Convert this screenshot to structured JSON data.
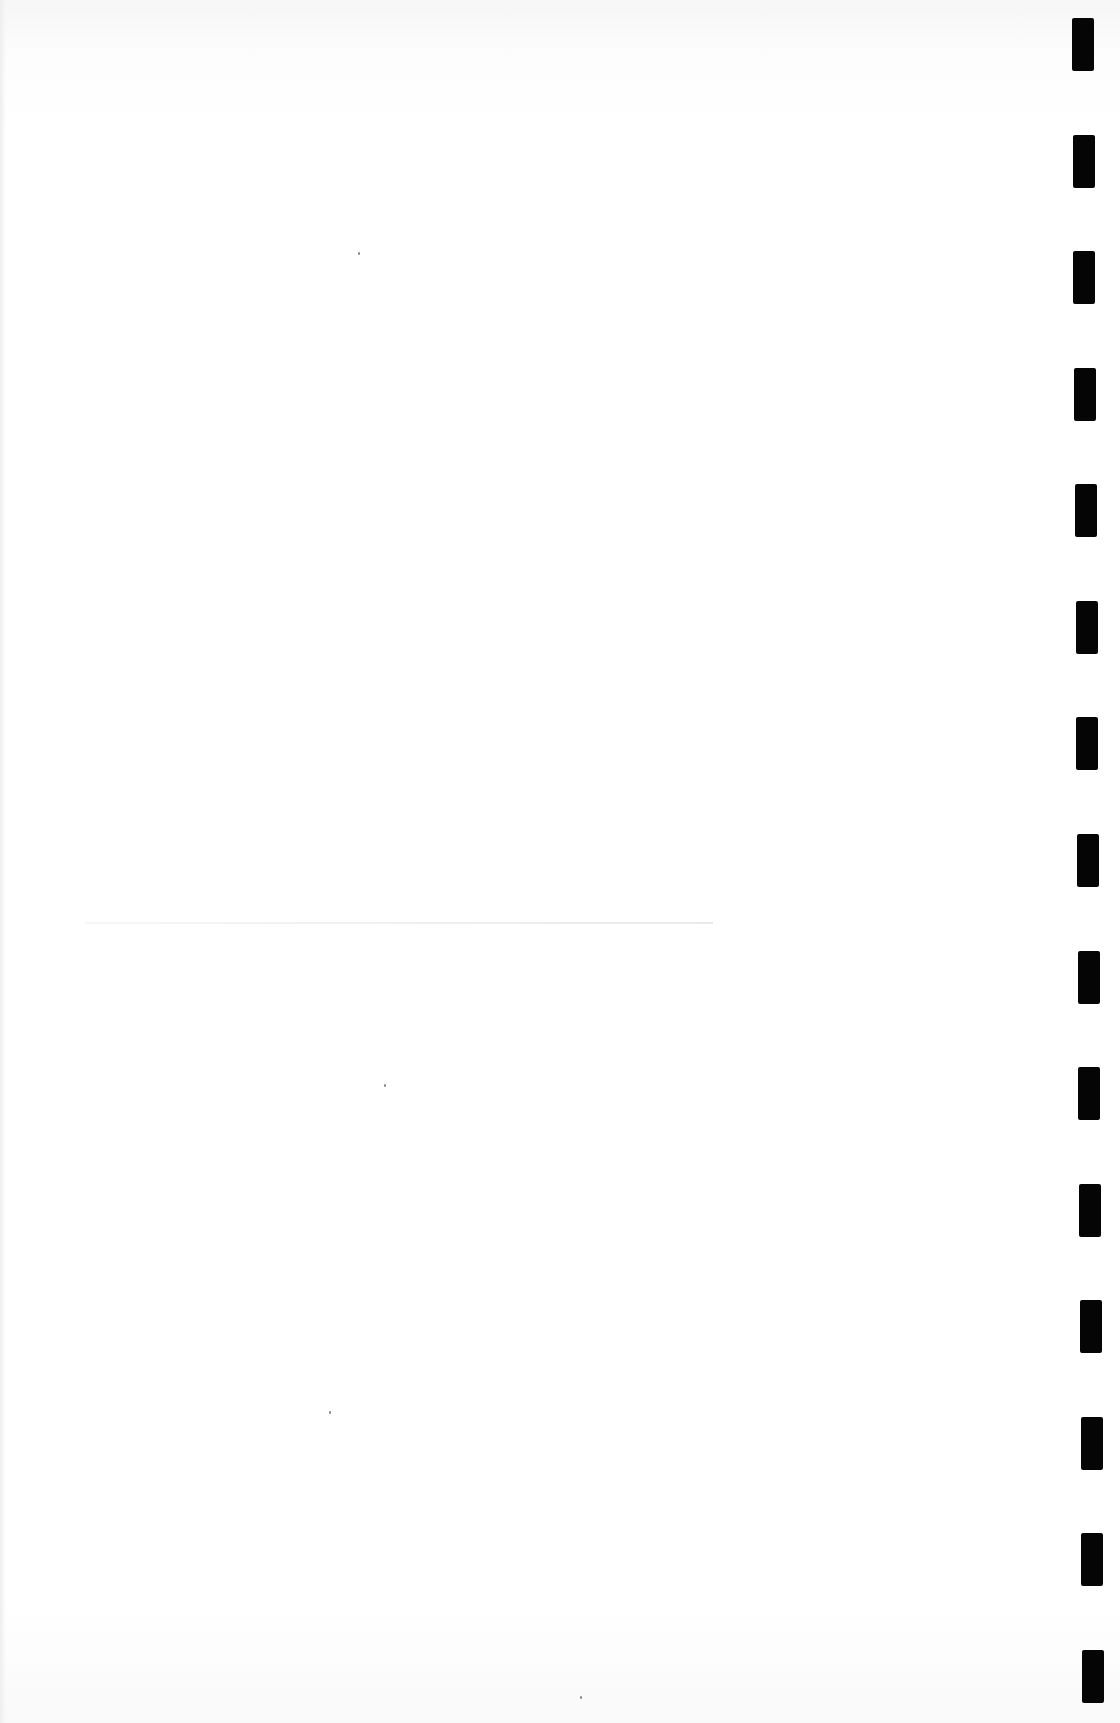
{
  "document": {
    "type": "blank scanned page",
    "text_content": "",
    "background_color": "#ffffff",
    "binding": {
      "side": "right",
      "hole_count": 15,
      "hole_color": "#050505",
      "holes": [
        {
          "x": 1073,
          "y": 18
        },
        {
          "x": 1073,
          "y": 111
        },
        {
          "x": 1074,
          "y": 206
        },
        {
          "x": 1074,
          "y": 300
        },
        {
          "x": 1075,
          "y": 395
        },
        {
          "x": 1075,
          "y": 490
        },
        {
          "x": 1075,
          "y": 584
        },
        {
          "x": 1076,
          "y": 678
        },
        {
          "x": 1076,
          "y": 773
        },
        {
          "x": 1077,
          "y": 868
        },
        {
          "x": 1078,
          "y": 963
        },
        {
          "x": 1078,
          "y": 1056
        },
        {
          "x": 1079,
          "y": 1150
        },
        {
          "x": 1079,
          "y": 1244
        },
        {
          "x": 1080,
          "y": 1339
        }
      ]
    },
    "faint_rule": {
      "x": 85,
      "y": 922,
      "width": 628
    },
    "specks": [
      {
        "x": 358,
        "y": 252
      },
      {
        "x": 384,
        "y": 1084
      },
      {
        "x": 329,
        "y": 1411
      },
      {
        "x": 580,
        "y": 1696
      }
    ]
  }
}
